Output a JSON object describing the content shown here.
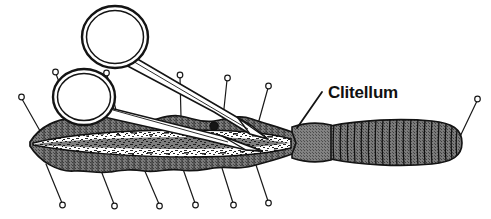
{
  "figure": {
    "background_color": "#ffffff",
    "width": 491,
    "height": 219
  },
  "labels": [
    {
      "id": "clitellum",
      "text": "Clitellum",
      "text_x": 328,
      "text_y": 98,
      "leader_from_x": 322,
      "leader_from_y": 92,
      "leader_to_x": 297,
      "leader_to_y": 128
    }
  ],
  "colors": {
    "ink": "#1a1a1a",
    "body_gray": "#6e6e6e",
    "body_gray_dark": "#575757",
    "cavity_white": "#ffffff",
    "clitellum_gray": "#7a7a7a",
    "paper": "#ffffff"
  },
  "specimen": {
    "name": "earthworm",
    "anterior_label": "dissected anterior body",
    "clitellum_label": "clitellum band",
    "posterior_label": "segmented posterior tail",
    "cavity_label": "opened body cavity"
  },
  "instrument": {
    "name": "dissecting scissors",
    "ring_upper_label": "upper finger ring",
    "ring_lower_label": "lower finger ring",
    "shank_label": "scissor shank",
    "blade_label": "scissor blade",
    "pivot_label": "scissor pivot screw"
  },
  "pins": {
    "count": 13,
    "label": "dissecting pin",
    "top": [
      {
        "head_x": 56,
        "head_y": 72,
        "tip_x": 74,
        "tip_y": 121
      },
      {
        "head_x": 107,
        "head_y": 73,
        "tip_x": 118,
        "tip_y": 118
      },
      {
        "head_x": 180,
        "head_y": 75,
        "tip_x": 181,
        "tip_y": 117
      },
      {
        "head_x": 227,
        "head_y": 78,
        "tip_x": 223,
        "tip_y": 118
      },
      {
        "head_x": 268,
        "head_y": 86,
        "tip_x": 258,
        "tip_y": 123
      }
    ],
    "left": [
      {
        "head_x": 22,
        "head_y": 97,
        "tip_x": 44,
        "tip_y": 138
      }
    ],
    "bottom": [
      {
        "head_x": 62,
        "head_y": 205,
        "tip_x": 46,
        "tip_y": 166
      },
      {
        "head_x": 114,
        "head_y": 206,
        "tip_x": 100,
        "tip_y": 170
      },
      {
        "head_x": 159,
        "head_y": 206,
        "tip_x": 144,
        "tip_y": 171
      },
      {
        "head_x": 195,
        "head_y": 205,
        "tip_x": 183,
        "tip_y": 171
      },
      {
        "head_x": 233,
        "head_y": 205,
        "tip_x": 222,
        "tip_y": 170
      },
      {
        "head_x": 268,
        "head_y": 203,
        "tip_x": 256,
        "tip_y": 167
      }
    ],
    "right": [
      {
        "head_x": 477,
        "head_y": 99,
        "tip_x": 456,
        "tip_y": 145
      }
    ]
  }
}
